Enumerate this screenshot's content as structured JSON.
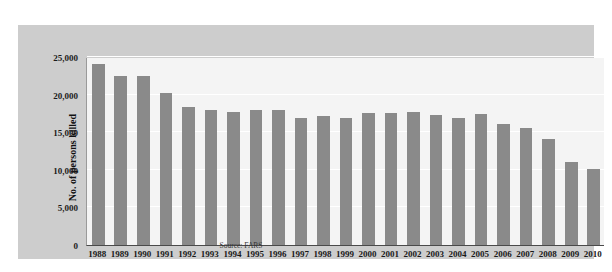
{
  "figure": {
    "top_text_fragment": "",
    "source_note": "Source: FARS",
    "colors": {
      "panel_background": "#cdcdcd",
      "plot_background": "#f4f4f4",
      "bar_fill": "#8a8a8a",
      "gridline": "#ffffff",
      "axis_line": "#4a4a4a",
      "text": "#1a1a1a"
    }
  },
  "chart_data": {
    "type": "bar",
    "title": "",
    "subtitle": "",
    "xlabel": "",
    "ylabel": "No. of persons killed",
    "source": "Source: FARS",
    "ylim": [
      0,
      25000
    ],
    "ytick_values": [
      0,
      5000,
      10000,
      15000,
      20000,
      25000
    ],
    "ytick_labels": [
      "0",
      "5,000",
      "10,000",
      "15,000",
      "20,000",
      "25,000"
    ],
    "grid": true,
    "legend": false,
    "categories": [
      "1988",
      "1989",
      "1990",
      "1991",
      "1992",
      "1993",
      "1994",
      "1995",
      "1996",
      "1997",
      "1998",
      "1999",
      "2000",
      "2001",
      "2002",
      "2003",
      "2004",
      "2005",
      "2006",
      "2007",
      "2008",
      "2009",
      "2010"
    ],
    "values": [
      24050,
      22500,
      22500,
      20250,
      18300,
      18000,
      17750,
      18000,
      18000,
      16950,
      17100,
      16950,
      17500,
      17500,
      17700,
      17350,
      16850,
      17450,
      16100,
      15550,
      14050,
      11000,
      10100
    ],
    "series": [
      {
        "name": "No. of persons killed",
        "values": [
          24050,
          22500,
          22500,
          20250,
          18300,
          18000,
          17750,
          18000,
          18000,
          16950,
          17100,
          16950,
          17500,
          17500,
          17700,
          17350,
          16850,
          17450,
          16100,
          15550,
          14050,
          11000,
          10100
        ]
      }
    ]
  }
}
